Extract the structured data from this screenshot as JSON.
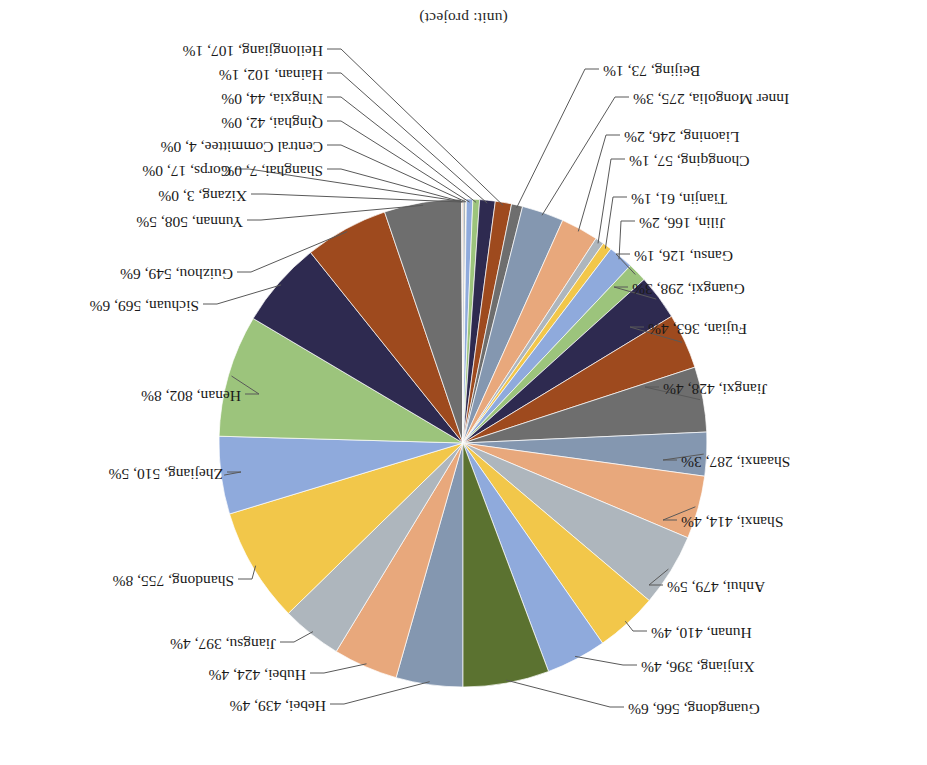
{
  "chart_title": "(unit: project)",
  "chart_data": {
    "type": "pie",
    "title": "(unit: project)",
    "unit": "project",
    "legend": "none",
    "labels_show": "name, value, percent",
    "rotated_180": true,
    "total": 9474,
    "categories": [
      "Hebei",
      "Hubei",
      "Jiangsu",
      "Shandong",
      "Zhejiang",
      "Henan",
      "Sichuan",
      "Guizhou",
      "Yunnan",
      "Xizang",
      "Shanghai",
      "Corps",
      "Central Committee",
      "Qinghai",
      "Ningxia",
      "Hainan",
      "Heilongjiang",
      "Beijing",
      "Inner Mongolia",
      "Liaoning",
      "Chongqing",
      "Tianjin",
      "Jilin",
      "Gansu",
      "Guangxi",
      "Fujian",
      "Jiangxi",
      "Shaanxi",
      "Shanxi",
      "Anhui",
      "Hunan",
      "Xinjiang",
      "Guangdong"
    ],
    "values": [
      439,
      424,
      397,
      755,
      510,
      802,
      569,
      549,
      508,
      3,
      7,
      17,
      4,
      42,
      44,
      102,
      107,
      73,
      275,
      246,
      57,
      61,
      166,
      126,
      298,
      363,
      428,
      287,
      414,
      479,
      410,
      396,
      566
    ],
    "percents": [
      "4%",
      "4%",
      "4%",
      "8%",
      "5%",
      "8%",
      "6%",
      "6%",
      "5%",
      "0%",
      "0%",
      "0%",
      "0%",
      "0%",
      "0%",
      "1%",
      "1%",
      "1%",
      "3%",
      "2%",
      "1%",
      "1%",
      "2%",
      "1%",
      "3%",
      "4%",
      "4%",
      "3%",
      "4%",
      "5%",
      "4%",
      "4%",
      "6%"
    ],
    "colors": [
      "#8497B0",
      "#E8A87C",
      "#AEB6BD",
      "#F2C74A",
      "#8FAADC",
      "#9CC47C",
      "#2E2A50",
      "#9E4A1E",
      "#6E6E6E",
      "#8497B0",
      "#E8A87C",
      "#AEB6BD",
      "#F2C74A",
      "#8FAADC",
      "#9CC47C",
      "#2E2A50",
      "#9E4A1E",
      "#6E6E6E",
      "#8497B0",
      "#E8A87C",
      "#AEB6BD",
      "#F2C74A",
      "#8FAADC",
      "#9CC47C",
      "#2E2A50",
      "#9E4A1E",
      "#6E6E6E",
      "#8497B0",
      "#E8A87C",
      "#AEB6BD",
      "#F2C74A",
      "#8FAADC",
      "#5B7230"
    ]
  },
  "labels": [
    {
      "id": "hebei",
      "text": "Hebei, 439, 4%"
    },
    {
      "id": "hubei",
      "text": "Hubei, 424, 4%"
    },
    {
      "id": "jiangsu",
      "text": "Jiangsu, 397, 4%"
    },
    {
      "id": "shandong",
      "text": "Shandong, 755, 8%"
    },
    {
      "id": "zhejiang",
      "text": "Zhejiang, 510, 5%"
    },
    {
      "id": "henan",
      "text": "Henan, 802, 8%"
    },
    {
      "id": "sichuan",
      "text": "Sichuan, 569, 6%"
    },
    {
      "id": "guizhou",
      "text": "Guizhou, 549, 6%"
    },
    {
      "id": "yunnan",
      "text": "Yunnan, 508, 5%"
    },
    {
      "id": "xizang",
      "text": "Xizang, 3, 0%"
    },
    {
      "id": "shanghai",
      "text": "Shanghai, 7, 0%"
    },
    {
      "id": "corps",
      "text": "Corps, 17, 0%"
    },
    {
      "id": "central",
      "text": "Central Committee, 4, 0%"
    },
    {
      "id": "qinghai",
      "text": "Qinghai, 42, 0%"
    },
    {
      "id": "ningxia",
      "text": "Ningxia, 44, 0%"
    },
    {
      "id": "hainan",
      "text": "Hainan, 102, 1%"
    },
    {
      "id": "heilongjiang",
      "text": "Heilongjiang, 107, 1%"
    },
    {
      "id": "beijing",
      "text": "Beijing, 73, 1%"
    },
    {
      "id": "innermongolia",
      "text": "Inner Mongolia, 275, 3%"
    },
    {
      "id": "liaoning",
      "text": "Liaoning, 246, 2%"
    },
    {
      "id": "chongqing",
      "text": "Chongqing, 57, 1%"
    },
    {
      "id": "tianjin",
      "text": "Tianjin, 61, 1%"
    },
    {
      "id": "jilin",
      "text": "Jilin, 166, 2%"
    },
    {
      "id": "gansu",
      "text": "Gansu, 126, 1%"
    },
    {
      "id": "guangxi",
      "text": "Guangxi, 298, 3%"
    },
    {
      "id": "fujian",
      "text": "Fujian, 363, 4%"
    },
    {
      "id": "jiangxi",
      "text": "Jiangxi, 428, 4%"
    },
    {
      "id": "shaanxi",
      "text": "Shaanxi, 287, 3%"
    },
    {
      "id": "shanxi",
      "text": "Shanxi, 414, 4%"
    },
    {
      "id": "anhui",
      "text": "Anhui, 479, 5%"
    },
    {
      "id": "hunan",
      "text": "Hunan, 410, 4%"
    },
    {
      "id": "xinjiang",
      "text": "Xinjiang, 396, 4%"
    },
    {
      "id": "guangdong",
      "text": "Guangdong, 566, 6%"
    }
  ]
}
